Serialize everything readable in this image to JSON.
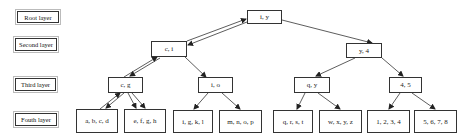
{
  "layers": [
    {
      "label": "Root layer"
    },
    {
      "label": "Second layer"
    },
    {
      "label": "Third layer"
    },
    {
      "label": "Fouth layer"
    }
  ],
  "nodes": {
    "root": {
      "label": "i, y"
    },
    "second": [
      {
        "label": "c, i"
      },
      {
        "label": "y, 4"
      }
    ],
    "third": [
      {
        "label": "c, g"
      },
      {
        "label": "i, o"
      },
      {
        "label": "q, y"
      },
      {
        "label": "4, 5"
      }
    ],
    "fourth": [
      {
        "label": "a, b, c, d"
      },
      {
        "label": "e, f, g, h"
      },
      {
        "label": "i, g, k, l"
      },
      {
        "label": "m, n, o, p"
      },
      {
        "label": "q, r, s, t"
      },
      {
        "label": "w, x, y, z"
      },
      {
        "label": "1, 2, 3, 4"
      },
      {
        "label": "5, 6, 7, 8"
      }
    ]
  },
  "colors": {
    "line": "#333333",
    "background": "#ffffff"
  }
}
